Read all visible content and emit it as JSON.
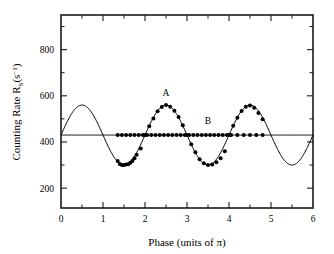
{
  "chart_data": {
    "type": "line",
    "title": "",
    "subtitle": "",
    "xlabel": "Phase (units of π)",
    "ylabel_parts": {
      "main": "Counting Rate R",
      "sub": "S",
      "paren_open": "(s",
      "sup": "−1",
      "paren_close": ")"
    },
    "ylabel": "Counting Rate R_S(s^-1)",
    "xlim": [
      0,
      6
    ],
    "ylim": [
      114,
      950
    ],
    "xticks": [
      0,
      1,
      2,
      3,
      4,
      5,
      6
    ],
    "xtick_labels": [
      "0",
      "1",
      "2",
      "3",
      "4",
      "5",
      "6"
    ],
    "xminor_ticks": [
      0.5,
      1.5,
      2.5,
      3.5,
      4.5,
      5.5
    ],
    "yticks": [
      200,
      400,
      600,
      800
    ],
    "ytick_labels": [
      "200",
      "400",
      "600",
      "800"
    ],
    "yminor_ticks": [
      300,
      500,
      700,
      900
    ],
    "grid": false,
    "legend_position": "inline-annotations",
    "annotations": [
      {
        "text": "A",
        "x": 2.5,
        "y": 600
      },
      {
        "text": "B",
        "x": 3.5,
        "y": 478
      }
    ],
    "series": [
      {
        "name": "A",
        "kind": "sinusoid-fit-with-points",
        "baseline": 430,
        "amplitude": 130,
        "period": 2,
        "phase_offset": 0.5,
        "fit_xrange": [
          0,
          6
        ],
        "marker": "filled-circle",
        "points_x": [
          1.35,
          1.4,
          1.45,
          1.5,
          1.55,
          1.6,
          1.65,
          1.7,
          1.75,
          1.8,
          1.9,
          2.0,
          2.1,
          2.2,
          2.3,
          2.4,
          2.5,
          2.6,
          2.7,
          2.8,
          2.9,
          3.0,
          3.1,
          3.2,
          3.3,
          3.4,
          3.5,
          3.6,
          3.7,
          3.8,
          3.9,
          4.0,
          4.1,
          4.2,
          4.3,
          4.4,
          4.5,
          4.6,
          4.7,
          4.8
        ],
        "points_y": [
          318,
          305,
          300,
          300,
          302,
          304,
          310,
          318,
          330,
          345,
          372,
          430,
          468,
          502,
          533,
          552,
          560,
          553,
          535,
          508,
          472,
          430,
          390,
          355,
          325,
          308,
          300,
          302,
          312,
          330,
          360,
          430,
          470,
          505,
          534,
          553,
          558,
          548,
          525,
          498
        ]
      },
      {
        "name": "B",
        "kind": "flat-line-with-points",
        "baseline": 430,
        "amplitude": 0,
        "fit_xrange": [
          0,
          6
        ],
        "marker": "filled-circle",
        "points_x": [
          1.35,
          1.45,
          1.55,
          1.65,
          1.75,
          1.85,
          1.95,
          2.05,
          2.15,
          2.25,
          2.35,
          2.45,
          2.55,
          2.65,
          2.75,
          2.85,
          2.95,
          3.05,
          3.15,
          3.25,
          3.35,
          3.45,
          3.55,
          3.65,
          3.75,
          3.85,
          3.95,
          4.05,
          4.2,
          4.35,
          4.5,
          4.65,
          4.8
        ],
        "points_y": [
          430,
          430,
          430,
          430,
          430,
          430,
          430,
          430,
          430,
          430,
          430,
          430,
          430,
          430,
          430,
          430,
          430,
          430,
          430,
          430,
          430,
          430,
          430,
          430,
          430,
          430,
          430,
          430,
          430,
          430,
          430,
          430,
          430
        ]
      }
    ],
    "colors": {
      "line": "#000000",
      "marker": "#000000",
      "axis": "#1a1a1a",
      "background": "#ffffff"
    }
  }
}
